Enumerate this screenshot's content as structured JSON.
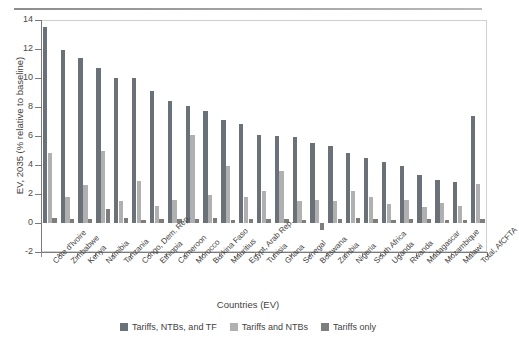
{
  "chart_data": {
    "type": "bar",
    "title": "",
    "xlabel": "Countries (EV)",
    "ylabel": "EV, 2035 (% relative to baseline)",
    "ylim": [
      -2,
      14
    ],
    "yticks": [
      -2,
      0,
      2,
      4,
      6,
      8,
      10,
      12,
      14
    ],
    "grid": false,
    "legend_position": "bottom",
    "categories": [
      "Côte d'Ivoire",
      "Zimbabwe",
      "Kenya",
      "Namibia",
      "Tanzania",
      "Congo, Dem. Rep.",
      "Ethiopia",
      "Cameroon",
      "Morocco",
      "Burkina Faso",
      "Mauritius",
      "Egypt, Arab Rep.",
      "Tunisia",
      "Ghana",
      "Senegal",
      "Botswana",
      "Zambia",
      "Nigeria",
      "South Africa",
      "Uganda",
      "Rwanda",
      "Madagascar",
      "Mozambique",
      "Malawi",
      "Total, AfCFTA"
    ],
    "series": [
      {
        "name": "Tariffs, NTBs, and TF",
        "color": "#6b7179",
        "values": [
          13.5,
          11.9,
          11.4,
          10.7,
          10.0,
          10.0,
          9.1,
          8.4,
          8.1,
          7.7,
          7.1,
          6.8,
          6.1,
          6.0,
          5.9,
          5.5,
          5.3,
          4.8,
          4.5,
          4.2,
          3.9,
          3.3,
          3.0,
          2.8,
          7.4
        ]
      },
      {
        "name": "Tariffs and NTBs",
        "color": "#b0b0b0",
        "values": [
          4.8,
          1.8,
          2.6,
          5.0,
          1.5,
          2.9,
          1.2,
          1.6,
          6.1,
          1.9,
          3.9,
          1.8,
          2.2,
          3.6,
          1.5,
          1.6,
          1.5,
          2.2,
          1.8,
          1.3,
          1.6,
          1.1,
          1.4,
          1.2,
          2.7
        ]
      },
      {
        "name": "Tariffs only",
        "color": "#7d7d7d",
        "values": [
          0.35,
          0.25,
          0.3,
          1.0,
          0.35,
          0.2,
          0.25,
          0.3,
          0.3,
          0.35,
          0.2,
          0.3,
          0.25,
          0.25,
          0.2,
          -0.45,
          0.25,
          0.35,
          0.3,
          0.2,
          0.3,
          0.3,
          0.2,
          0.2,
          0.25
        ]
      }
    ]
  },
  "legend": {
    "items": [
      {
        "label": "Tariffs, NTBs, and TF"
      },
      {
        "label": "Tariffs and NTBs"
      },
      {
        "label": "Tariffs only"
      }
    ]
  }
}
